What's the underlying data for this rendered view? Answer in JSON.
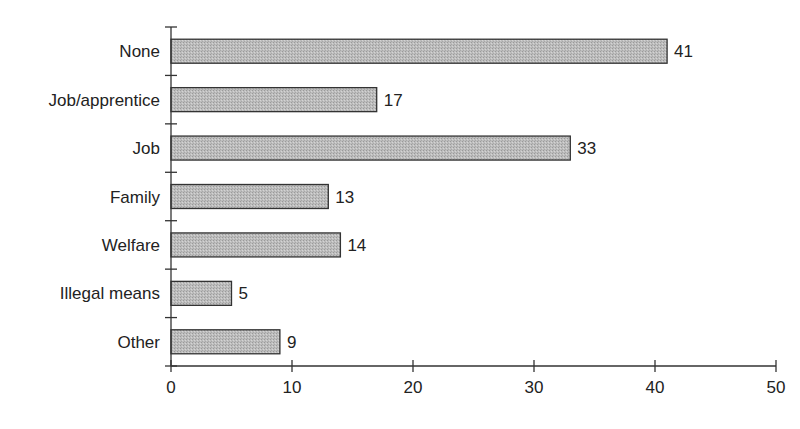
{
  "chart_data": {
    "type": "bar",
    "orientation": "horizontal",
    "title": "",
    "xlabel": "",
    "ylabel": "",
    "categories": [
      "None",
      "Job/apprentice",
      "Job",
      "Family",
      "Welfare",
      "Illegal means",
      "Other"
    ],
    "values": [
      41,
      17,
      33,
      13,
      14,
      5,
      9
    ],
    "data_labels": [
      "41",
      "17",
      "33",
      "13",
      "14",
      "5",
      "9"
    ],
    "xlim": [
      0,
      50
    ],
    "xticks": [
      0,
      10,
      20,
      30,
      40,
      50
    ],
    "xtick_labels": [
      "0",
      "10",
      "20",
      "30",
      "40",
      "50"
    ],
    "grid": false,
    "legend": null,
    "bar_fill": "#b8b8b8",
    "bar_stroke": "#333333"
  }
}
